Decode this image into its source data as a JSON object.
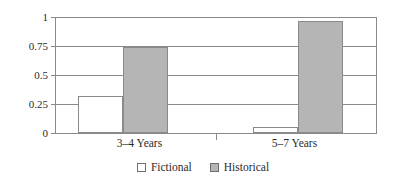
{
  "chart_data": {
    "type": "bar",
    "title": "",
    "subtitle": "",
    "xlabel": "",
    "ylabel": "",
    "categories": [
      "3–4 Years",
      "5–7 Years"
    ],
    "series": [
      {
        "name": "Fictional",
        "values": [
          0.32,
          0.05
        ],
        "color": "#ffffff"
      },
      {
        "name": "Historical",
        "values": [
          0.75,
          0.97
        ],
        "color": "#b5b5b5"
      }
    ],
    "ylim": [
      0,
      1
    ],
    "yticks": [
      0,
      0.25,
      0.5,
      0.75,
      1
    ],
    "ytick_labels": [
      "0",
      "0.25",
      "0.5",
      "0.75",
      "1"
    ],
    "grid": true,
    "grid_axis": "y",
    "legend_position": "bottom-center",
    "frame": true,
    "colors": {
      "fictional": "#ffffff",
      "historical": "#b5b5b5",
      "axis": "#8a8a8a",
      "text": "#2b2b2b",
      "background": "#ffffff"
    }
  },
  "legend": {
    "items": [
      {
        "label": "Fictional",
        "swatch": "white-square-swatch"
      },
      {
        "label": "Historical",
        "swatch": "gray-square-swatch"
      }
    ]
  }
}
